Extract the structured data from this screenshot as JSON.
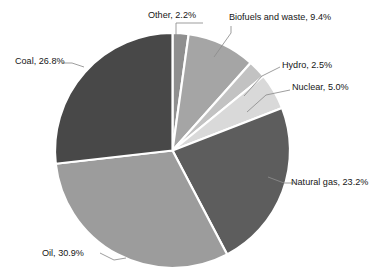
{
  "chart_data": {
    "type": "pie",
    "title": "",
    "xlabel": "",
    "ylabel": "",
    "unit": "%",
    "start_angle_deg": 0,
    "direction": "clockwise",
    "legend": "none",
    "grid": false,
    "labels_position": "outside-with-leader-lines",
    "categories": [
      "Other",
      "Biofuels and waste",
      "Hydro",
      "Nuclear",
      "Natural gas",
      "Oil",
      "Coal"
    ],
    "values": [
      2.2,
      9.4,
      2.5,
      5.0,
      23.2,
      30.9,
      26.8
    ],
    "colors": [
      "#8f8f8f",
      "#a5a5a5",
      "#c2c2c2",
      "#d9d9d9",
      "#5d5d5d",
      "#9c9c9c",
      "#484848"
    ],
    "slices": [
      {
        "name": "Other",
        "value": 2.2,
        "label": "Other, 2.2%",
        "color": "#8f8f8f"
      },
      {
        "name": "Biofuels and waste",
        "value": 9.4,
        "label": "Biofuels and waste, 9.4%",
        "color": "#a5a5a5"
      },
      {
        "name": "Hydro",
        "value": 2.5,
        "label": "Hydro, 2.5%",
        "color": "#c2c2c2"
      },
      {
        "name": "Nuclear",
        "value": 5.0,
        "label": "Nuclear, 5.0%",
        "color": "#d9d9d9"
      },
      {
        "name": "Natural gas",
        "value": 23.2,
        "label": "Natural gas, 23.2%",
        "color": "#5d5d5d"
      },
      {
        "name": "Oil",
        "value": 30.9,
        "label": "Oil, 30.9%",
        "color": "#9c9c9c"
      },
      {
        "name": "Coal",
        "value": 26.8,
        "label": "Coal, 26.8%",
        "color": "#484848"
      }
    ]
  },
  "labels": {
    "other": "Other, 2.2%",
    "biofuels": "Biofuels and waste, 9.4%",
    "hydro": "Hydro, 2.5%",
    "nuclear": "Nuclear, 5.0%",
    "natural_gas": "Natural gas, 23.2%",
    "oil": "Oil, 30.9%",
    "coal": "Coal, 26.8%"
  },
  "style": {
    "background": "#ffffff",
    "separator_color": "#ffffff",
    "leader_line_color": "#8c8c8c",
    "text_color": "#161616"
  }
}
